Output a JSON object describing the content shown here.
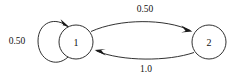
{
  "diagram": {
    "type": "markov-chain-state-diagram",
    "background_color": "#ffffff",
    "stroke_color": "#1a1a1a",
    "text_color": "#111111",
    "nodes": [
      {
        "id": "1",
        "label": "1",
        "cx": 76,
        "cy": 42,
        "r": 17
      },
      {
        "id": "2",
        "label": "2",
        "cx": 209,
        "cy": 42,
        "r": 17
      }
    ],
    "edges": [
      {
        "id": "self-loop-1",
        "from": "1",
        "to": "1",
        "label": "0.50",
        "label_x": 17,
        "label_y": 41,
        "shape": "self-loop-left"
      },
      {
        "id": "edge-1-to-2",
        "from": "1",
        "to": "2",
        "label": "0.50",
        "label_x": 145,
        "label_y": 9,
        "shape": "arc-upper"
      },
      {
        "id": "edge-2-to-1",
        "from": "2",
        "to": "1",
        "label": "1.0",
        "label_x": 146,
        "label_y": 69,
        "shape": "arc-lower"
      }
    ]
  }
}
